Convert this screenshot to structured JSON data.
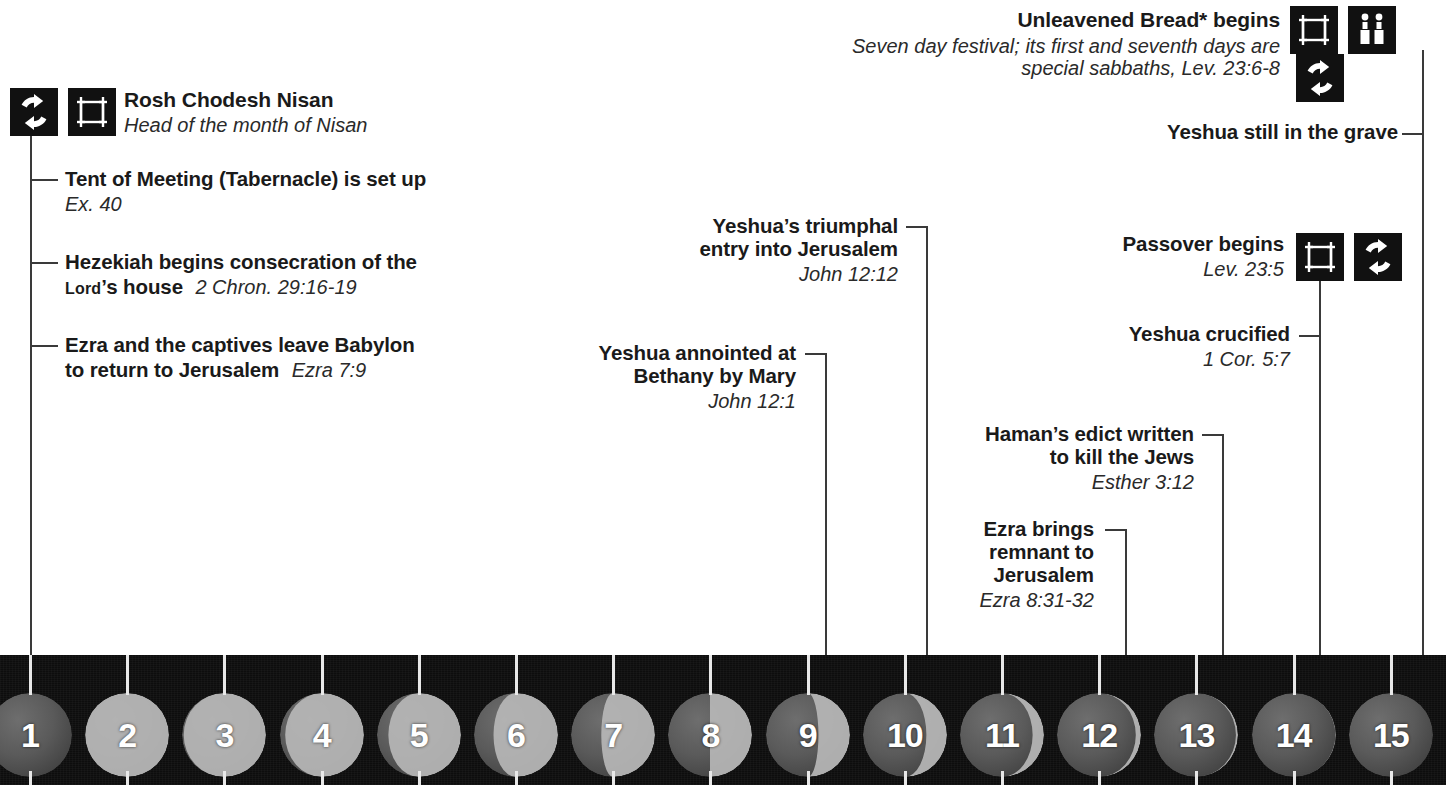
{
  "colors": {
    "line": "#3a3a3a",
    "icon_bg": "#111111",
    "strip_bg": "#0d0d0d",
    "tick": "#e8e8e8",
    "text": "#1a1a1a"
  },
  "events": [
    {
      "id": "rosh-chodesh-nisan",
      "title": "Rosh Chodesh Nisan",
      "subtitle": "Head of the month of Nisan",
      "icons": [
        "cycle-icon",
        "tabernacle-icon"
      ],
      "day": 1
    },
    {
      "id": "tent-of-meeting",
      "title": "Tent of Meeting (Tabernacle) is set up",
      "reference": "Ex. 40",
      "day": 1
    },
    {
      "id": "hezekiah-consecration",
      "title_part1": "Hezekiah begins consecration of the",
      "title_part2_smallcaps": "Lord",
      "title_part2_rest": "’s house",
      "reference": "2 Chron. 29:16-19",
      "day": 1
    },
    {
      "id": "ezra-captives-leave-babylon",
      "title_part1": "Ezra and the captives leave Babylon",
      "title_part2": "to return to Jerusalem",
      "reference": "Ezra 7:9",
      "day": 1
    },
    {
      "id": "yeshua-anointed-bethany",
      "title_line1": "Yeshua annointed at",
      "title_line2": "Bethany by Mary",
      "reference": "John 12:1",
      "day": 9
    },
    {
      "id": "yeshua-triumphal-entry",
      "title_line1": "Yeshua’s triumphal",
      "title_line2": "entry into Jerusalem",
      "reference": "John 12:12",
      "day": 10
    },
    {
      "id": "ezra-brings-remnant",
      "title_line1": "Ezra brings",
      "title_line2": "remnant to",
      "title_line3": "Jerusalem",
      "reference": "Ezra 8:31-32",
      "day": 12
    },
    {
      "id": "hamans-edict",
      "title_line1": "Haman’s edict written",
      "title_line2": "to kill the Jews",
      "reference": "Esther 3:12",
      "day": 13
    },
    {
      "id": "yeshua-crucified",
      "title": "Yeshua crucified",
      "reference": "1 Cor. 5:7",
      "day": 14
    },
    {
      "id": "passover-begins",
      "title": "Passover begins",
      "reference": "Lev. 23:5",
      "icons": [
        "tabernacle-icon",
        "cycle-icon"
      ],
      "day": 14
    },
    {
      "id": "yeshua-still-in-grave",
      "title": "Yeshua still in the grave",
      "day": 15
    },
    {
      "id": "unleavened-bread-begins",
      "title": "Unleavened Bread* begins",
      "subtitle_line1": "Seven day festival; its first and seventh days are",
      "subtitle_line2": "special sabbaths, Lev. 23:6-8",
      "icons": [
        "tabernacle-icon",
        "candles-icon",
        "cycle-icon"
      ],
      "day": 15
    }
  ],
  "calendar": {
    "days": [
      {
        "number": "1",
        "phase": 0.0
      },
      {
        "number": "2",
        "phase": 0.04
      },
      {
        "number": "3",
        "phase": 0.09
      },
      {
        "number": "4",
        "phase": 0.16
      },
      {
        "number": "5",
        "phase": 0.24
      },
      {
        "number": "6",
        "phase": 0.32
      },
      {
        "number": "7",
        "phase": 0.41
      },
      {
        "number": "8",
        "phase": 0.5
      },
      {
        "number": "9",
        "phase": 0.58
      },
      {
        "number": "10",
        "phase": 0.67
      },
      {
        "number": "11",
        "phase": 0.76
      },
      {
        "number": "12",
        "phase": 0.84
      },
      {
        "number": "13",
        "phase": 0.9
      },
      {
        "number": "14",
        "phase": 0.95
      },
      {
        "number": "15",
        "phase": 0.99
      }
    ]
  }
}
